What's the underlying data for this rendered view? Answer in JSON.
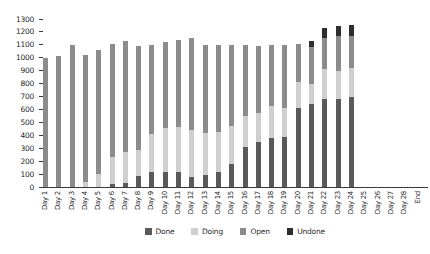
{
  "chart_data": {
    "type": "bar",
    "stacked": true,
    "title": "",
    "xlabel": "",
    "ylabel": "",
    "grid": false,
    "legend_position": "bottom",
    "ylim": [
      0,
      1300
    ],
    "ytick_step": 100,
    "ytick_labels": [
      "0",
      "100",
      "200",
      "300",
      "400",
      "500",
      "600",
      "700",
      "800",
      "900",
      "1000",
      "1100",
      "1200",
      "1300"
    ],
    "categories": [
      "Day 1",
      "Day 2",
      "Day 3",
      "Day 4",
      "Day 5",
      "Day 6",
      "Day 7",
      "Day 8",
      "Day 9",
      "Day 10",
      "Day 11",
      "Day 12",
      "Day 13",
      "Day 14",
      "Day 15",
      "Day 16",
      "Day 17",
      "Day 18",
      "Day 19",
      "Day 20",
      "Day 21",
      "Day 22",
      "Day 23",
      "Day 24",
      "Day 25",
      "Day 26",
      "Day 27",
      "Day 28",
      "End"
    ],
    "series": [
      {
        "name": "Done",
        "color": "#5a5a5a",
        "values": [
          0,
          0,
          0,
          0,
          0,
          20,
          30,
          85,
          115,
          120,
          115,
          80,
          95,
          115,
          175,
          310,
          345,
          380,
          390,
          610,
          645,
          680,
          680,
          700,
          0,
          0,
          0,
          0,
          0
        ]
      },
      {
        "name": "Doing",
        "color": "#cfcfcf",
        "values": [
          0,
          0,
          0,
          40,
          100,
          210,
          240,
          200,
          295,
          335,
          350,
          360,
          320,
          310,
          295,
          240,
          225,
          245,
          225,
          200,
          150,
          235,
          220,
          220,
          0,
          0,
          0,
          0,
          0
        ]
      },
      {
        "name": "Open",
        "color": "#8c8c8c",
        "values": [
          1000,
          1010,
          1100,
          980,
          960,
          880,
          860,
          810,
          690,
          665,
          675,
          710,
          685,
          675,
          630,
          550,
          520,
          475,
          485,
          300,
          290,
          235,
          265,
          250,
          0,
          0,
          0,
          0,
          0
        ]
      },
      {
        "name": "Undone",
        "color": "#2d2d2d",
        "values": [
          0,
          0,
          0,
          0,
          0,
          0,
          0,
          0,
          0,
          0,
          0,
          0,
          0,
          0,
          0,
          0,
          0,
          0,
          0,
          0,
          45,
          80,
          80,
          85,
          0,
          0,
          0,
          0,
          0
        ]
      }
    ]
  },
  "axis_color": "#3a3a3a"
}
